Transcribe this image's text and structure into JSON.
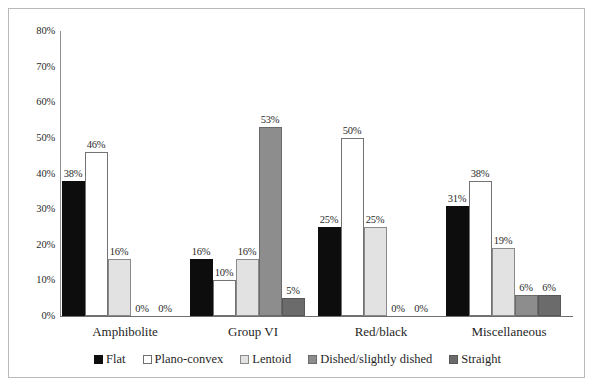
{
  "chart_data": {
    "type": "bar",
    "title": "",
    "xlabel": "",
    "ylabel": "",
    "ylim": [
      0,
      80
    ],
    "ytick_labels": [
      "80%",
      "70%",
      "60%",
      "50%",
      "40%",
      "30%",
      "20%",
      "10%",
      "0%"
    ],
    "ytick_values": [
      80,
      70,
      60,
      50,
      40,
      30,
      20,
      10,
      0
    ],
    "grid": false,
    "legend_position": "bottom",
    "categories": [
      "Amphibolite",
      "Group VI",
      "Red/black",
      "Miscellaneous"
    ],
    "series": [
      {
        "name": "Flat",
        "color": "#0d0d0d",
        "values": [
          38,
          16,
          25,
          31
        ],
        "labels": [
          "38%",
          "16%",
          "25%",
          "31%"
        ]
      },
      {
        "name": "Plano-convex",
        "color": "#ffffff",
        "values": [
          46,
          10,
          50,
          38
        ],
        "labels": [
          "46%",
          "10%",
          "50%",
          "38%"
        ]
      },
      {
        "name": "Lentoid",
        "color": "#e2e2e2",
        "values": [
          16,
          16,
          25,
          19
        ],
        "labels": [
          "16%",
          "16%",
          "25%",
          "19%"
        ]
      },
      {
        "name": "Dished/slightly dished",
        "color": "#8d8d8d",
        "values": [
          0,
          53,
          0,
          6
        ],
        "labels": [
          "0%",
          "53%",
          "0%",
          "6%"
        ]
      },
      {
        "name": "Straight",
        "color": "#6b6b6b",
        "values": [
          0,
          5,
          0,
          6
        ],
        "labels": [
          "0%",
          "5%",
          "0%",
          "6%"
        ]
      }
    ]
  }
}
